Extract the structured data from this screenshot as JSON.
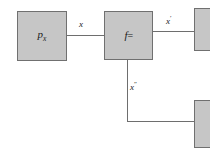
{
  "diagram": {
    "type": "block-diagram",
    "background_color": "#ffffff",
    "block_fill_color": "#c6c6c6",
    "block_border_color": "#707070",
    "wire_color": "#6e6e6e",
    "text_color": "#1a1a1a",
    "blocks": [
      {
        "id": "px",
        "label_base": "p",
        "label_sub": "x",
        "label_full": "p_x"
      },
      {
        "id": "f",
        "label_base": "f",
        "label_eq": "=",
        "label_full": "f="
      },
      {
        "id": "right-top",
        "label_full": ""
      },
      {
        "id": "right-bottom",
        "label_full": ""
      }
    ],
    "edges": [
      {
        "id": "px-to-f",
        "label_base": "x",
        "label_prime": "",
        "label_full": "x",
        "from": "px",
        "to": "f"
      },
      {
        "id": "f-to-right-top",
        "label_base": "x",
        "label_prime": "′",
        "label_full": "x′",
        "from": "f",
        "to": "right-top"
      },
      {
        "id": "f-to-right-bottom",
        "label_base": "x",
        "label_prime": "″",
        "label_full": "x″",
        "from": "f",
        "to": "right-bottom"
      }
    ]
  }
}
